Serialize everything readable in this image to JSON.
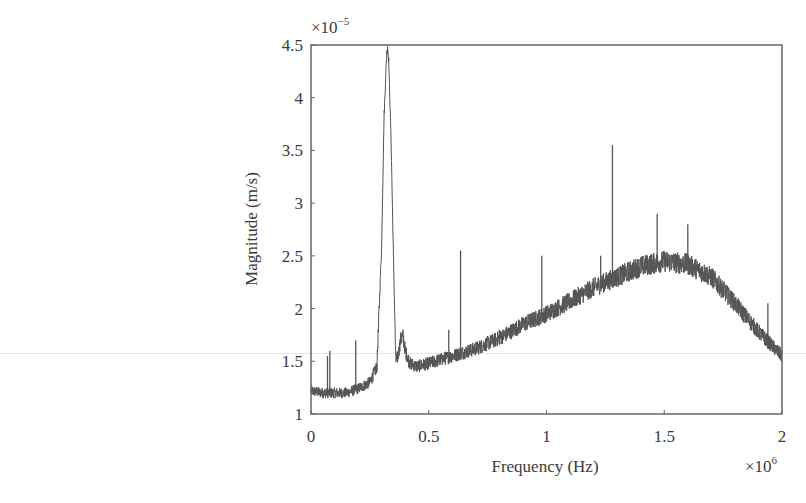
{
  "chart_data": {
    "type": "line",
    "title": "",
    "xlabel": "Frequency (Hz)",
    "ylabel": "Magnitude (m/s)",
    "x_multiplier": "×10^6",
    "y_multiplier": "×10^-5",
    "xlim": [
      0,
      2
    ],
    "ylim": [
      1,
      4.5
    ],
    "x_ticks": [
      0,
      0.5,
      1,
      1.5,
      2
    ],
    "x_tick_labels": [
      "0",
      "0.5",
      "1",
      "1.5",
      "2"
    ],
    "y_ticks": [
      1,
      1.5,
      2,
      2.5,
      3,
      3.5,
      4,
      4.5
    ],
    "y_tick_labels": [
      "1",
      "1.5",
      "2",
      "2.5",
      "3",
      "3.5",
      "4",
      "4.5"
    ],
    "grid": false,
    "legend": null,
    "line_color": "#555555",
    "series": [
      {
        "name": "Magnitude spectrum",
        "envelope": {
          "x": [
            0,
            0.05,
            0.1,
            0.15,
            0.2,
            0.25,
            0.28,
            0.3,
            0.31,
            0.32,
            0.325,
            0.33,
            0.34,
            0.35,
            0.36,
            0.37,
            0.38,
            0.39,
            0.4,
            0.42,
            0.45,
            0.5,
            0.6,
            0.7,
            0.8,
            0.9,
            1.0,
            1.1,
            1.2,
            1.3,
            1.4,
            1.5,
            1.6,
            1.7,
            1.8,
            1.9,
            2.0
          ],
          "y": [
            1.22,
            1.2,
            1.2,
            1.2,
            1.24,
            1.3,
            1.45,
            2.6,
            3.8,
            4.35,
            4.5,
            4.35,
            3.6,
            2.5,
            1.5,
            1.55,
            1.7,
            1.75,
            1.6,
            1.48,
            1.45,
            1.48,
            1.55,
            1.62,
            1.72,
            1.85,
            1.95,
            2.07,
            2.2,
            2.3,
            2.4,
            2.45,
            2.42,
            2.3,
            2.05,
            1.78,
            1.55
          ]
        },
        "noise_amplitude": 0.07,
        "spikes": [
          {
            "x": 0.07,
            "y": 1.55
          },
          {
            "x": 0.08,
            "y": 1.6
          },
          {
            "x": 0.19,
            "y": 1.7
          },
          {
            "x": 0.585,
            "y": 1.8
          },
          {
            "x": 0.635,
            "y": 2.55
          },
          {
            "x": 0.8,
            "y": 1.8
          },
          {
            "x": 0.98,
            "y": 2.5
          },
          {
            "x": 1.23,
            "y": 2.5
          },
          {
            "x": 1.28,
            "y": 3.55
          },
          {
            "x": 1.47,
            "y": 2.9
          },
          {
            "x": 1.6,
            "y": 2.8
          },
          {
            "x": 1.94,
            "y": 2.05
          }
        ]
      }
    ]
  },
  "labels": {
    "xlabel": "Frequency (Hz)",
    "ylabel": "Magnitude (m/s)",
    "x_multiplier_base": "×10",
    "x_multiplier_exp": "6",
    "y_multiplier_base": "×10",
    "y_multiplier_exp": "−5"
  }
}
